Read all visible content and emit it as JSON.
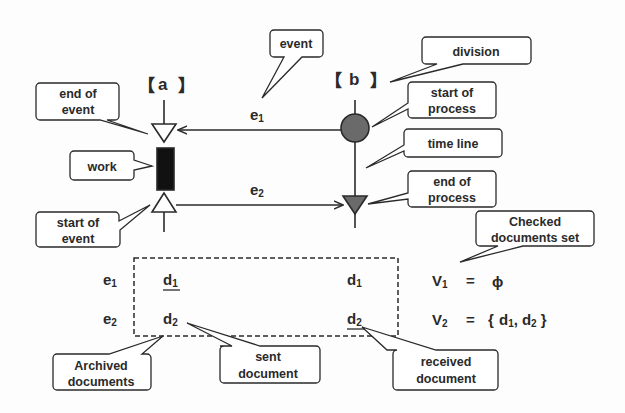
{
  "lanes": {
    "a": {
      "open": "【",
      "name": "a",
      "close": "】"
    },
    "b": {
      "open": "【",
      "name": "b",
      "close": "】"
    }
  },
  "events": {
    "e1": {
      "base": "e",
      "sub": "1"
    },
    "e2": {
      "base": "e",
      "sub": "2"
    }
  },
  "callouts": {
    "event": [
      "event"
    ],
    "division": [
      "division"
    ],
    "end_of_event": [
      "end of",
      "event"
    ],
    "work": [
      "work"
    ],
    "start_of_event": [
      "start of",
      "event"
    ],
    "start_of_process": [
      "start of",
      "process"
    ],
    "time_line": [
      "time line"
    ],
    "end_of_process": [
      "end of",
      "process"
    ],
    "checked_documents_set": [
      "Checked",
      "documents set"
    ],
    "archived_documents": [
      "Archived",
      "documents"
    ],
    "sent_document": [
      "sent",
      "document"
    ],
    "received_document": [
      "received",
      "document"
    ]
  },
  "table": {
    "rows": [
      {
        "event": {
          "base": "e",
          "sub": "1"
        },
        "a_doc": {
          "base": "d",
          "sub": "1",
          "underline": true
        },
        "b_doc": {
          "base": "d",
          "sub": "1",
          "underline": false
        }
      },
      {
        "event": {
          "base": "e",
          "sub": "2"
        },
        "a_doc": {
          "base": "d",
          "sub": "2",
          "underline": false
        },
        "b_doc": {
          "base": "d",
          "sub": "2",
          "underline": true
        }
      }
    ]
  },
  "sets": {
    "v1": {
      "base": "V",
      "sub": "1",
      "eq": "=",
      "value": "ϕ"
    },
    "v2": {
      "base": "V",
      "sub": "2",
      "eq": "=",
      "value_open": "{",
      "items": [
        {
          "base": "d",
          "sub": "1"
        },
        {
          "base": "d",
          "sub": "2"
        }
      ],
      "sep": ",",
      "value_close": "}"
    }
  },
  "colors": {
    "ink": "#2a2a2a",
    "process_fill": "#6a6a6a",
    "work_fill": "#111111",
    "background": "#fdfdfd"
  }
}
